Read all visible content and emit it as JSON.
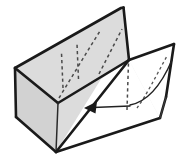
{
  "figure": {
    "background_color": "#ffffff",
    "line_color": "#1a1a1a",
    "shade_color": "#dcdcdc",
    "white_face_color": "#ffffff",
    "dashed_crease_color": "#4a4a4a",
    "arrow_color": "#222222",
    "caption": "",
    "labels": [],
    "notation": {
      "solid_line": "visible edge",
      "dashed_line": "hidden crease",
      "arrow": "fold direction"
    },
    "geometry": {
      "canvas_width": 184,
      "canvas_height": 163,
      "back_panel": {
        "name": "back-panel",
        "shade": "#dcdcdc",
        "points": "15,68 120,8 123,7 129,60 58,103"
      },
      "left_end_cap": {
        "name": "left-end-cap",
        "shade": "#d2d2d2",
        "points": "15,68 58,103 56,152 16,117"
      },
      "front_lower_panel": {
        "name": "front-lower-panel",
        "shade": "#dcdcdc",
        "points": "58,103 129,60 160,118 56,152"
      },
      "right_flap": {
        "name": "right-flap",
        "shade": "#ffffff",
        "points": "129,60 174,44 166,97 160,118"
      },
      "front_white_wedge": {
        "name": "front-white-wedge",
        "shade": "#ffffff",
        "points": "101,79 129,60 160,118 56,152"
      },
      "hidden_creases": [
        "63,88 62,53",
        "78,79 77,44",
        "97,67 123,25",
        "100,76 124,30"
      ],
      "flap_hidden_creases": [
        "126,110 128,63",
        "141,108 150,70 166,55"
      ],
      "motion_curve": "130,104 150,98 164,82 172,62",
      "arrow": {
        "shaft": "129,107 92,108",
        "head_points": "84,108 96,102 95,113"
      }
    }
  }
}
